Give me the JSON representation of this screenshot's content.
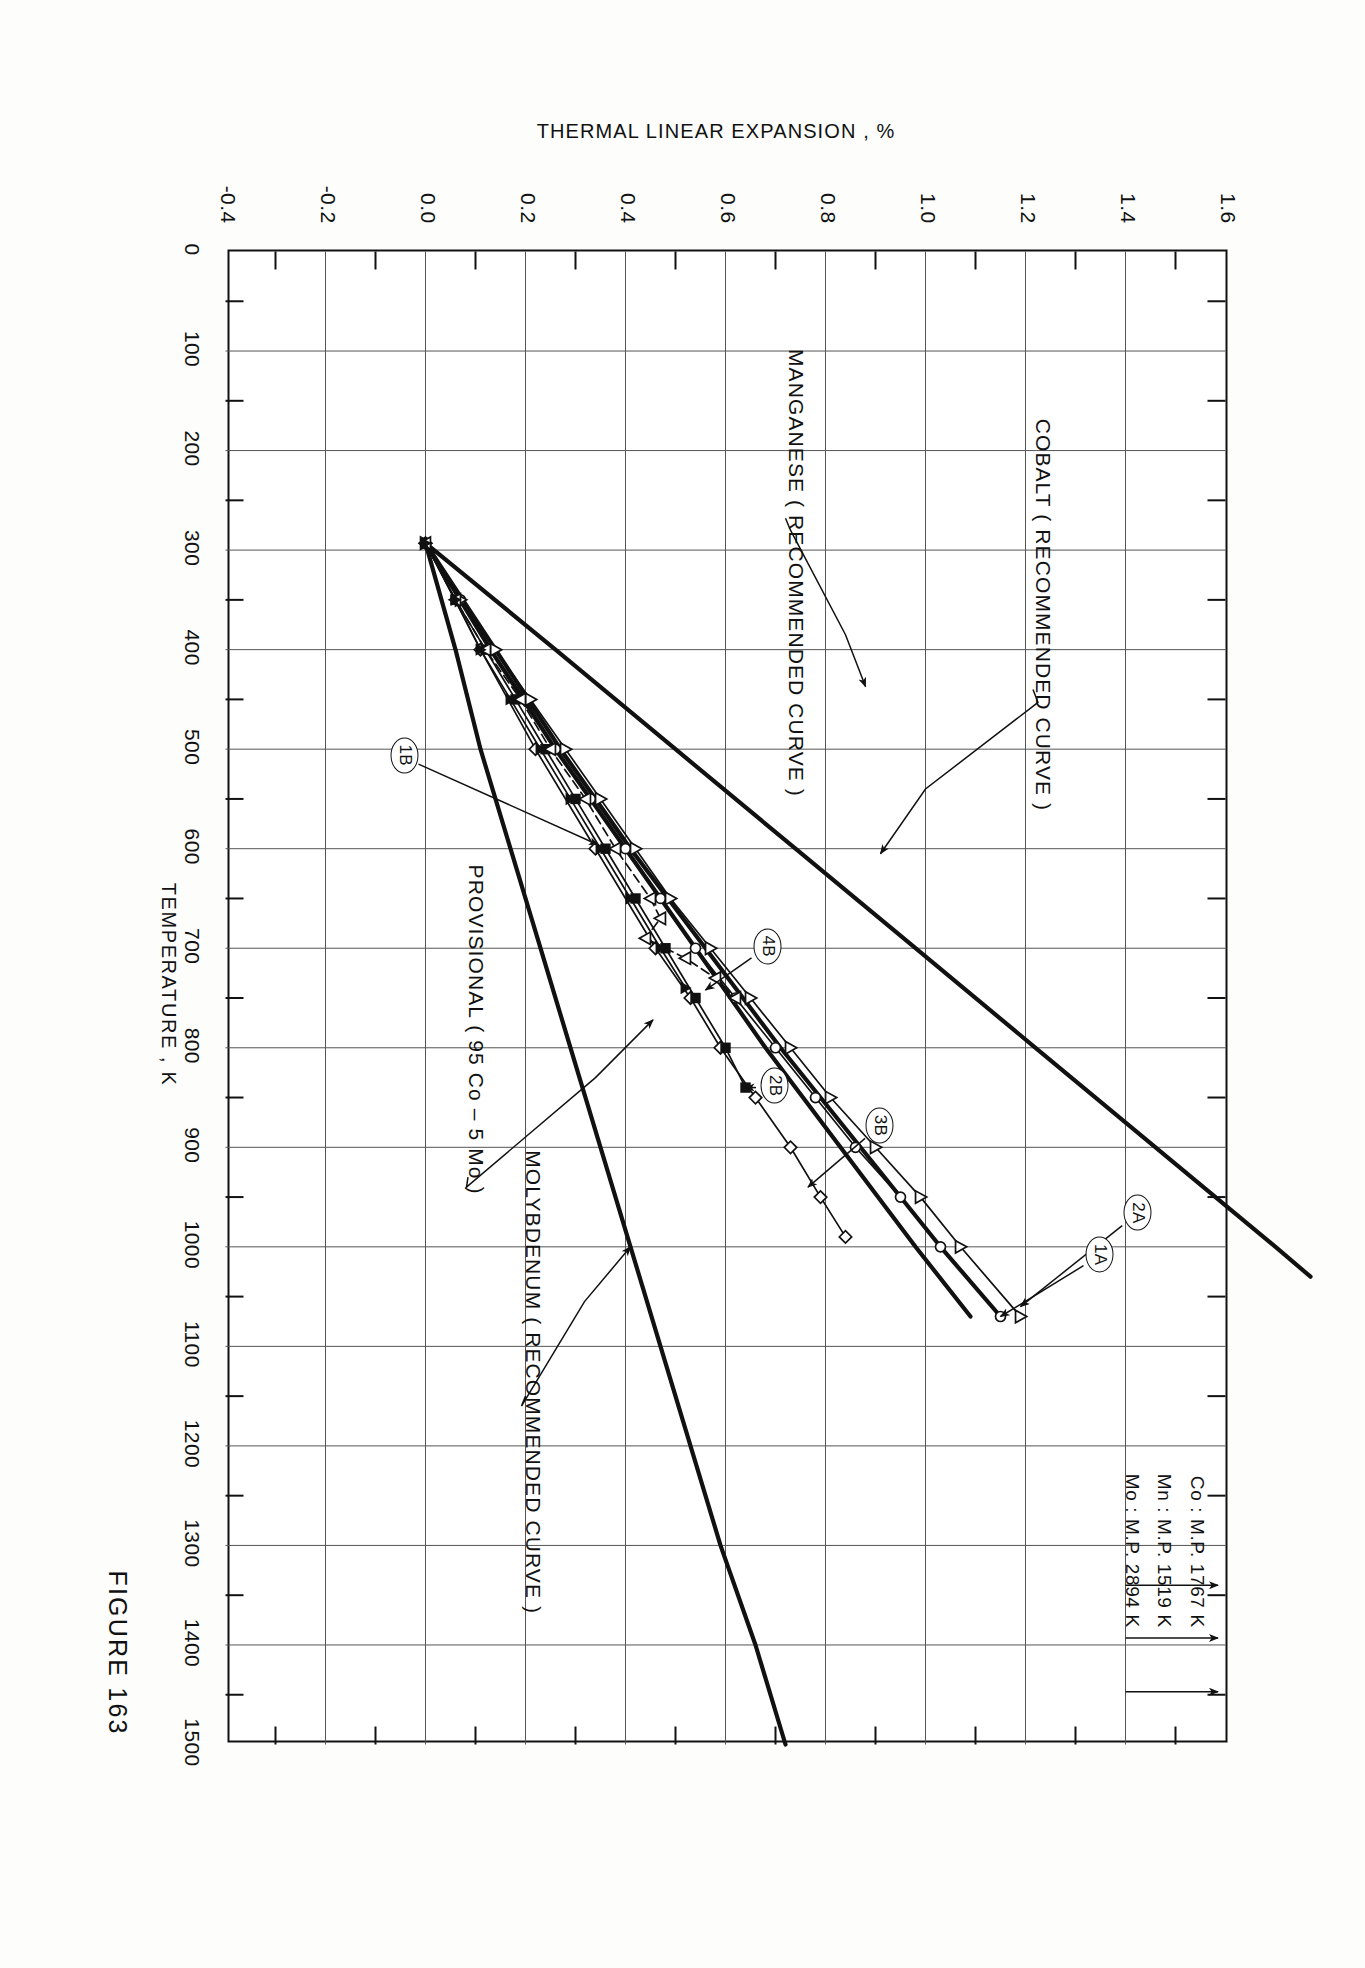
{
  "figure": {
    "caption": "FIGURE 163",
    "title_lines": [
      "THERMAL  LINEAR  EXPANSION  OF",
      "A. COBALT – MANGANESE  SYSTEM   Co - Mn",
      "B. COBALT – MOLYBDENUM  SYSTEM   Co - Mo"
    ]
  },
  "axes": {
    "x_title": "TEMPERATURE , K",
    "y_title": "THERMAL  LINEAR  EXPANSION ,  %",
    "x_ticks": [
      "0",
      "100",
      "200",
      "300",
      "400",
      "500",
      "600",
      "700",
      "800",
      "900",
      "1000",
      "1100",
      "1200",
      "1300",
      "1400",
      "1500"
    ],
    "y_ticks": [
      "-0.4",
      "-0.2",
      "0.0",
      "0.2",
      "0.4",
      "0.6",
      "0.8",
      "1.0",
      "1.2",
      "1.4",
      "1.6"
    ],
    "x_range": [
      0,
      1500
    ],
    "y_range": [
      -0.4,
      1.6
    ]
  },
  "annotations": {
    "cobalt": "COBALT  ( RECOMMENDED  CURVE )",
    "manganese": "MANGANESE  ( RECOMMENDED  CURVE )",
    "molybdenum": "MOLYBDENUM  ( RECOMMENDED  CURVE )",
    "provisional": "PROVISIONAL  ( 95 Co  –  5 Mo )"
  },
  "curve_labels": [
    {
      "id": "1A",
      "x": 1090,
      "y": 1.33
    },
    {
      "id": "2A",
      "x": 1060,
      "y": 1.4
    },
    {
      "id": "3B",
      "x": 920,
      "y": 0.87
    },
    {
      "id": "2B",
      "x": 845,
      "y": 0.62
    },
    {
      "id": "4B",
      "x": 745,
      "y": 0.72
    },
    {
      "id": "1B",
      "x": 505,
      "y": 0.0
    }
  ],
  "melting_points": [
    {
      "element": "Co",
      "label": "Co :  M.P.  1767 K",
      "temperature_k": 1767
    },
    {
      "element": "Mn",
      "label": "Mn :  M.P.  1519 K",
      "temperature_k": 1519
    },
    {
      "element": "Mo",
      "label": "Mo :  M.P.  2894 K",
      "temperature_k": 2894
    }
  ],
  "chart_data": {
    "type": "line",
    "title": "THERMAL  LINEAR  EXPANSION  OF  A. COBALT – MANGANESE  SYSTEM   Co - Mn   B. COBALT – MOLYBDENUM  SYSTEM   Co - Mo",
    "xlabel": "TEMPERATURE , K",
    "ylabel": "THERMAL  LINEAR  EXPANSION ,  %",
    "xlim": [
      0,
      1500
    ],
    "ylim": [
      -0.4,
      1.6
    ],
    "grid": true,
    "legend": "none",
    "reference_temperature_k": 293,
    "series": [
      {
        "name": "MANGANESE (RECOMMENDED CURVE)",
        "style": "thick-solid",
        "points": [
          [
            293,
            0.0
          ],
          [
            400,
            0.26
          ],
          [
            500,
            0.5
          ],
          [
            600,
            0.74
          ],
          [
            700,
            0.98
          ],
          [
            800,
            1.22
          ],
          [
            900,
            1.46
          ],
          [
            1000,
            1.7
          ],
          [
            1030,
            1.77
          ]
        ]
      },
      {
        "name": "COBALT (RECOMMENDED CURVE)",
        "style": "thick-solid",
        "points": [
          [
            293,
            0.0
          ],
          [
            400,
            0.14
          ],
          [
            500,
            0.27
          ],
          [
            600,
            0.41
          ],
          [
            700,
            0.56
          ],
          [
            800,
            0.71
          ],
          [
            900,
            0.87
          ],
          [
            1000,
            1.03
          ],
          [
            1070,
            1.15
          ]
        ]
      },
      {
        "name": "MOLYBDENUM (RECOMMENDED CURVE)",
        "style": "thick-solid",
        "points": [
          [
            293,
            0.0
          ],
          [
            400,
            0.06
          ],
          [
            500,
            0.11
          ],
          [
            600,
            0.17
          ],
          [
            700,
            0.23
          ],
          [
            800,
            0.29
          ],
          [
            900,
            0.35
          ],
          [
            1000,
            0.41
          ],
          [
            1100,
            0.47
          ],
          [
            1200,
            0.53
          ],
          [
            1300,
            0.59
          ],
          [
            1400,
            0.66
          ],
          [
            1500,
            0.72
          ]
        ]
      },
      {
        "name": "PROVISIONAL (95 Co - 5 Mo)",
        "style": "thick-solid",
        "points": [
          [
            293,
            0.0
          ],
          [
            400,
            0.13
          ],
          [
            500,
            0.26
          ],
          [
            600,
            0.4
          ],
          [
            700,
            0.54
          ],
          [
            800,
            0.68
          ],
          [
            900,
            0.83
          ],
          [
            1000,
            0.98
          ],
          [
            1070,
            1.09
          ]
        ]
      },
      {
        "name": "Curve 1A",
        "style": "open-circle",
        "points": [
          [
            293,
            0.0
          ],
          [
            350,
            0.07
          ],
          [
            400,
            0.13
          ],
          [
            450,
            0.2
          ],
          [
            500,
            0.26
          ],
          [
            550,
            0.33
          ],
          [
            600,
            0.4
          ],
          [
            650,
            0.47
          ],
          [
            700,
            0.54
          ],
          [
            750,
            0.62
          ],
          [
            800,
            0.7
          ],
          [
            850,
            0.78
          ],
          [
            900,
            0.86
          ],
          [
            950,
            0.95
          ],
          [
            1000,
            1.03
          ],
          [
            1070,
            1.15
          ]
        ]
      },
      {
        "name": "Curve 2A",
        "style": "open-triangle",
        "points": [
          [
            293,
            0.0
          ],
          [
            350,
            0.07
          ],
          [
            400,
            0.14
          ],
          [
            450,
            0.21
          ],
          [
            500,
            0.28
          ],
          [
            550,
            0.35
          ],
          [
            600,
            0.42
          ],
          [
            650,
            0.49
          ],
          [
            700,
            0.57
          ],
          [
            750,
            0.65
          ],
          [
            800,
            0.73
          ],
          [
            850,
            0.81
          ],
          [
            900,
            0.9
          ],
          [
            950,
            0.99
          ],
          [
            1000,
            1.07
          ],
          [
            1070,
            1.19
          ]
        ]
      },
      {
        "name": "Curve 3B",
        "style": "open-diamond",
        "points": [
          [
            293,
            0.0
          ],
          [
            400,
            0.11
          ],
          [
            500,
            0.22
          ],
          [
            600,
            0.34
          ],
          [
            700,
            0.46
          ],
          [
            750,
            0.53
          ],
          [
            800,
            0.59
          ],
          [
            850,
            0.66
          ],
          [
            900,
            0.73
          ],
          [
            950,
            0.79
          ],
          [
            990,
            0.84
          ]
        ]
      },
      {
        "name": "Curve 2B",
        "style": "filled-square",
        "points": [
          [
            293,
            0.0
          ],
          [
            350,
            0.06
          ],
          [
            400,
            0.12
          ],
          [
            450,
            0.18
          ],
          [
            500,
            0.24
          ],
          [
            550,
            0.3
          ],
          [
            600,
            0.36
          ],
          [
            650,
            0.42
          ],
          [
            700,
            0.48
          ],
          [
            750,
            0.54
          ],
          [
            800,
            0.6
          ],
          [
            840,
            0.64
          ]
        ]
      },
      {
        "name": "Curve 4B",
        "style": "open-inverted-triangle-dashed",
        "points": [
          [
            293,
            0.0
          ],
          [
            350,
            0.06
          ],
          [
            400,
            0.12
          ],
          [
            450,
            0.19
          ],
          [
            500,
            0.25
          ],
          [
            550,
            0.32
          ],
          [
            600,
            0.38
          ],
          [
            650,
            0.45
          ],
          [
            670,
            0.47
          ],
          [
            690,
            0.44
          ],
          [
            710,
            0.52
          ],
          [
            730,
            0.58
          ],
          [
            750,
            0.62
          ]
        ]
      },
      {
        "name": "Curve 1B",
        "style": "filled-triangle",
        "points": [
          [
            293,
            0.0
          ],
          [
            350,
            0.06
          ],
          [
            400,
            0.11
          ],
          [
            450,
            0.17
          ],
          [
            500,
            0.23
          ],
          [
            550,
            0.29
          ],
          [
            600,
            0.35
          ],
          [
            650,
            0.41
          ],
          [
            700,
            0.47
          ],
          [
            740,
            0.52
          ]
        ]
      }
    ]
  }
}
